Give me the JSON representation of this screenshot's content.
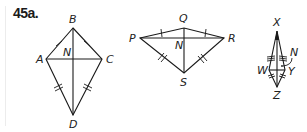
{
  "exercise_label": "45a.",
  "figures": [
    {
      "name": "kite-ABCD",
      "vertices": {
        "A": "A",
        "B": "B",
        "C": "C",
        "D": "D"
      },
      "intersection": "N",
      "congruent_marks": {
        "single": [
          "AB",
          "BC"
        ],
        "double": [
          "AD",
          "CD"
        ]
      }
    },
    {
      "name": "kite-PQRS",
      "vertices": {
        "P": "P",
        "Q": "Q",
        "R": "R",
        "S": "S"
      },
      "intersection": "N",
      "congruent_marks": {
        "single": [
          "PQ",
          "QR"
        ],
        "double": [
          "PS",
          "RS"
        ]
      }
    },
    {
      "name": "kite-XWZY",
      "vertices": {
        "X": "X",
        "W": "W",
        "Y": "Y",
        "Z": "Z"
      },
      "intersection": "N",
      "congruent_marks": {
        "triple": [
          "XW",
          "XY"
        ],
        "double": [
          "WZ",
          "YZ"
        ]
      }
    }
  ]
}
